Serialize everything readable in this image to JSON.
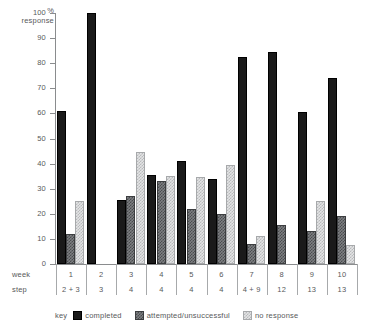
{
  "chart_data": {
    "type": "bar",
    "title": "",
    "xlabel": "week / step",
    "ylabel": "% response",
    "ylim": [
      0,
      100
    ],
    "yticks": [
      0,
      10,
      20,
      30,
      40,
      50,
      60,
      70,
      80,
      90,
      100
    ],
    "grid": false,
    "legend_position": "bottom",
    "categories": [
      "1",
      "2",
      "3",
      "4",
      "5",
      "6",
      "7",
      "8",
      "9",
      "10"
    ],
    "series": [
      {
        "name": "completed",
        "values": [
          61,
          100,
          25.5,
          35.5,
          41,
          34,
          82.5,
          84.5,
          60.5,
          74
        ]
      },
      {
        "name": "attempted/unsuccessful",
        "values": [
          12,
          0,
          27,
          33,
          22,
          20,
          8,
          15.5,
          13,
          19
        ]
      },
      {
        "name": "no response",
        "values": [
          25,
          0,
          44.5,
          35,
          34.5,
          39.5,
          11,
          0,
          25,
          7.5
        ]
      }
    ]
  },
  "axis": {
    "y_title_line1": "%",
    "y_title_line2": "response",
    "ticks": [
      {
        "value": 100,
        "label": "100"
      },
      {
        "value": 90,
        "label": "90"
      },
      {
        "value": 80,
        "label": "80"
      },
      {
        "value": 70,
        "label": "70"
      },
      {
        "value": 60,
        "label": "60"
      },
      {
        "value": 50,
        "label": "50"
      },
      {
        "value": 40,
        "label": "40"
      },
      {
        "value": 30,
        "label": "30"
      },
      {
        "value": 20,
        "label": "20"
      },
      {
        "value": 10,
        "label": "10"
      },
      {
        "value": 0,
        "label": "0"
      }
    ]
  },
  "category_axis": {
    "week_row_label": "week",
    "step_row_label": "step",
    "columns": [
      {
        "week": "1",
        "step": "2 + 3"
      },
      {
        "week": "2",
        "step": "3"
      },
      {
        "week": "3",
        "step": "4"
      },
      {
        "week": "4",
        "step": "4"
      },
      {
        "week": "5",
        "step": "4"
      },
      {
        "week": "6",
        "step": "4"
      },
      {
        "week": "7",
        "step": "4 + 9"
      },
      {
        "week": "8",
        "step": "12"
      },
      {
        "week": "9",
        "step": "13"
      },
      {
        "week": "10",
        "step": "13"
      }
    ]
  },
  "legend": {
    "title": "key",
    "items": [
      {
        "label": "completed",
        "swatch": "completed",
        "color": "#1a1a1a"
      },
      {
        "label": "attempted/unsuccessful",
        "swatch": "attempted",
        "color": "#7d7f82"
      },
      {
        "label": "no response",
        "swatch": "noresponse",
        "color": "#e3e4e5"
      }
    ]
  },
  "colors": {
    "completed": "#1a1a1a",
    "attempted": "#7d7f82",
    "no_response": "#e3e4e5",
    "axis": "#8a8c8e",
    "text": "#58595b",
    "background": "#ffffff"
  }
}
